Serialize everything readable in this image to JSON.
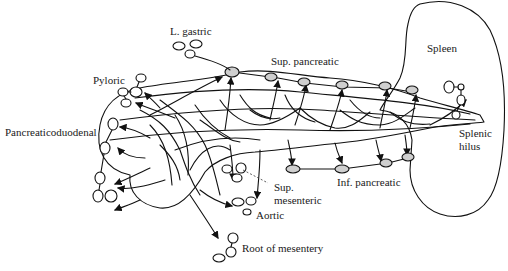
{
  "figure": {
    "organs": [
      {
        "name": "pancreas",
        "label": ""
      },
      {
        "name": "spleen",
        "label": "Spleen"
      }
    ],
    "labels": {
      "l_gastric": "L. gastric",
      "pyloric": "Pyloric",
      "pancreaticoduodenal": "Pancreaticoduodenal",
      "sup_pancreatic": "Sup. pancreatic",
      "spleen": "Spleen",
      "splenic_hilus_1": "Splenic",
      "splenic_hilus_2": "hilus",
      "inf_pancreatic": "Inf. pancreatic",
      "sup_mesenteric_1": "Sup.",
      "sup_mesenteric_2": "mesenteric",
      "aortic": "Aortic",
      "root_of_mesentery": "Root of mesentery"
    },
    "node_groups": [
      "L. gastric",
      "Pyloric",
      "Pancreaticoduodenal",
      "Sup. pancreatic",
      "Splenic hilus",
      "Inf. pancreatic",
      "Sup. mesenteric",
      "Aortic",
      "Root of mesentery"
    ],
    "colors": {
      "line": "#111111",
      "background": "#ffffff"
    }
  }
}
